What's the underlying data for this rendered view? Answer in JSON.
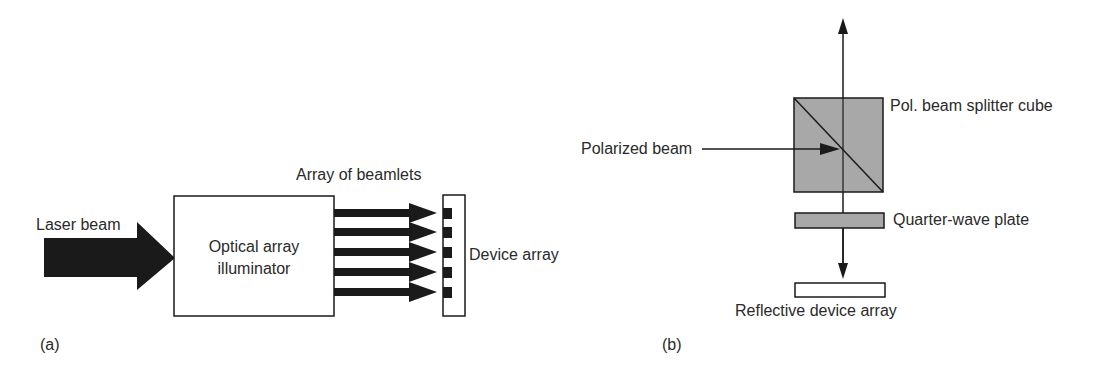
{
  "panel_a": {
    "caption": "(a)",
    "labels": {
      "laser_beam": "Laser beam",
      "illuminator_line1": "Optical array",
      "illuminator_line2": "illuminator",
      "beamlets": "Array of beamlets",
      "device_array": "Device array"
    },
    "beamlet_count": 5
  },
  "panel_b": {
    "caption": "(b)",
    "labels": {
      "splitter": "Pol. beam splitter cube",
      "polarized_beam": "Polarized beam",
      "quarter_wave": "Quarter-wave plate",
      "reflective_array": "Reflective device array"
    }
  },
  "colors": {
    "ink": "#1a1a1a",
    "gray_fill": "#a8a8a8",
    "text": "#2a2a2a"
  }
}
